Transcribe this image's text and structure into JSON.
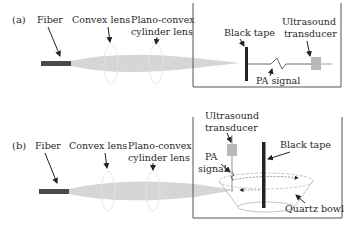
{
  "panels": [
    {
      "id": "a",
      "label": "(a)",
      "fiber_label": "Fiber",
      "convex_lens_label": "Convex lens",
      "cylinder_lens_label_line1": "Plano-convex",
      "cylinder_lens_label_line2": "cylinder lens",
      "black_tape_label": "Black tape",
      "transducer_label_line1": "Ultrasound",
      "transducer_label_line2": "transducer",
      "pa_signal_label": "PA signal"
    },
    {
      "id": "b",
      "label": "(b)",
      "fiber_label": "Fiber",
      "convex_lens_label": "Convex lens",
      "cylinder_lens_label_line1": "Plano-convex",
      "cylinder_lens_label_line2": "cylinder lens",
      "black_tape_label": "Black tape",
      "transducer_label_line1": "Ultrasound",
      "transducer_label_line2": "transducer",
      "pa_signal_label_line1": "PA",
      "pa_signal_label_line2": "signal",
      "quartz_bowl_label": "Quartz bowl"
    }
  ],
  "colors": {
    "fiber": "#4a4a4a",
    "beam": "#d6d6d6",
    "tape": "#222222",
    "transducer": "#b8b8b8",
    "tank_border": "#555555",
    "text": "#2a2a2a"
  }
}
